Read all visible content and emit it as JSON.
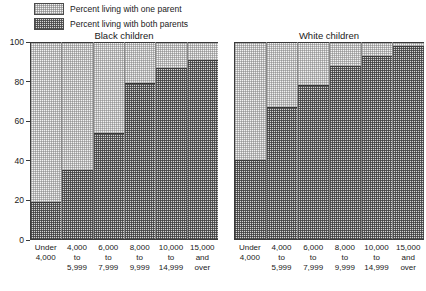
{
  "legend": {
    "items": [
      {
        "label": "Percent living with one parent",
        "swatch": "light-stipple-swatch"
      },
      {
        "label": "Percent living with both parents",
        "swatch": "dark-stipple-swatch"
      }
    ]
  },
  "y_axis": {
    "ticks": [
      "100",
      "80",
      "60",
      "40",
      "20",
      "0"
    ]
  },
  "panels": [
    {
      "title": "Black children"
    },
    {
      "title": "White children"
    }
  ],
  "categories": [
    "Under\n4,000",
    "4,000\nto\n5,999",
    "6,000\nto\n7,999",
    "8,000\nto\n9,999",
    "10,000\nto\n14,999",
    "15,000\nand\nover"
  ],
  "chart_data": {
    "type": "bar",
    "title": "",
    "subtitle": "",
    "xlabel": "",
    "ylabel": "",
    "ylim": [
      0,
      100
    ],
    "grid": false,
    "stacked": true,
    "legend_position": "top-left",
    "panels": [
      {
        "name": "Black children",
        "categories": [
          "Under 4,000",
          "4,000 to 5,999",
          "6,000 to 7,999",
          "8,000 to 9,999",
          "10,000 to 14,999",
          "15,000 and over"
        ],
        "series": [
          {
            "name": "Percent living with both parents",
            "values": [
              19,
              35,
              54,
              79,
              87,
              91
            ]
          },
          {
            "name": "Percent living with one parent",
            "values": [
              81,
              65,
              46,
              21,
              13,
              9
            ]
          }
        ],
        "totals": [
          100,
          100,
          100,
          100,
          100,
          100
        ]
      },
      {
        "name": "White children",
        "categories": [
          "Under 4,000",
          "4,000 to 5,999",
          "6,000 to 7,999",
          "8,000 to 9,999",
          "10,000 to 14,999",
          "15,000 and over"
        ],
        "series": [
          {
            "name": "Percent living with both parents",
            "values": [
              40,
              67,
              78,
              88,
              93,
              98
            ]
          },
          {
            "name": "Percent living with one parent",
            "values": [
              60,
              33,
              22,
              12,
              7,
              2
            ]
          }
        ],
        "totals": [
          100,
          100,
          100,
          100,
          100,
          100
        ]
      }
    ]
  }
}
